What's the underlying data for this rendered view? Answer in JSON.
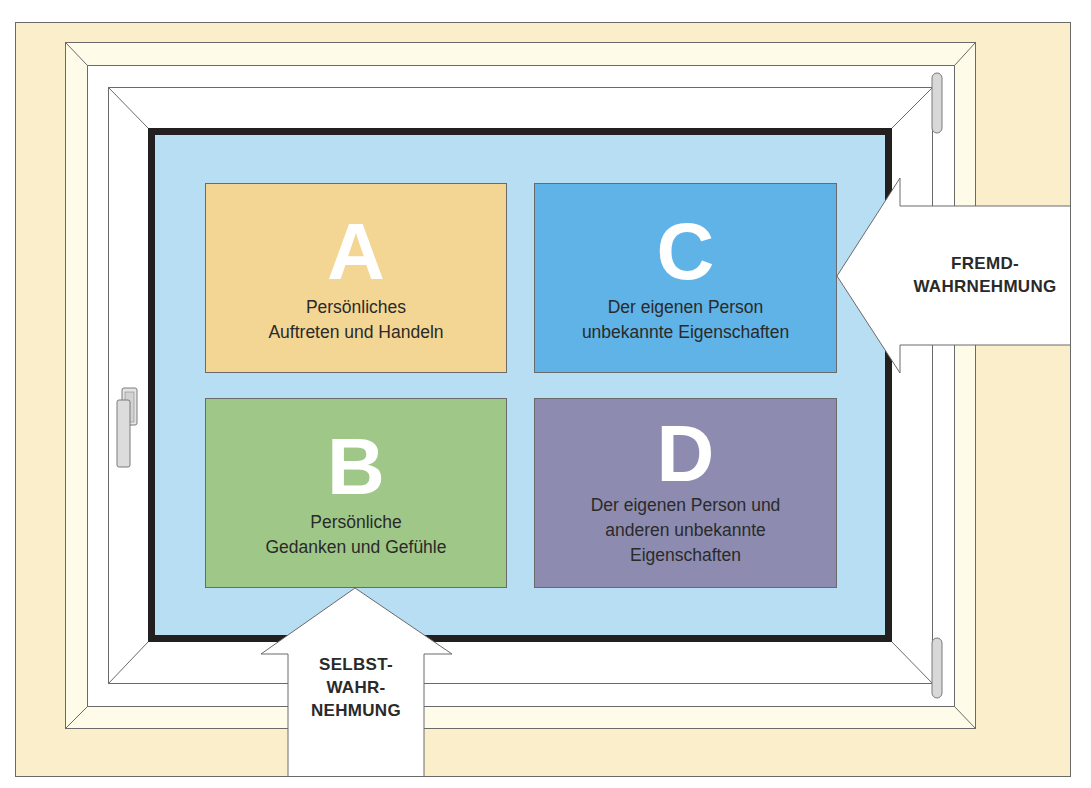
{
  "diagram": {
    "type": "window-model",
    "colors": {
      "wall": "#fbefcb",
      "frame_outer": "#fffbe9",
      "frame_inner": "#ffffff",
      "glass": "#b8def3",
      "glass_border": "#231f20",
      "pane_a": "#f3d693",
      "pane_b": "#9fc888",
      "pane_c": "#5fb3e6",
      "pane_d": "#8d8cb0",
      "arrow": "#ffffff",
      "text": "#2a2a2a"
    },
    "panes": [
      {
        "id": "A",
        "letter": "A",
        "description": "Persönliches\nAuftreten und Handeln"
      },
      {
        "id": "B",
        "letter": "B",
        "description": "Persönliche\nGedanken und Gefühle"
      },
      {
        "id": "C",
        "letter": "C",
        "description": "Der eigenen Person\nunbekannte Eigenschaften"
      },
      {
        "id": "D",
        "letter": "D",
        "description": "Der eigenen Person und\nanderen unbekannte\nEigenschaften"
      }
    ],
    "arrows": {
      "right": {
        "label": "FREMD-\nWAHRNEHMUNG",
        "direction": "left"
      },
      "bottom": {
        "label": "SELBST-\nWAHR-\nNEHMUNG",
        "direction": "up"
      }
    },
    "icons": {
      "handle": "window-handle-icon",
      "hinge_top": "hinge-icon",
      "hinge_bottom": "hinge-icon"
    }
  }
}
